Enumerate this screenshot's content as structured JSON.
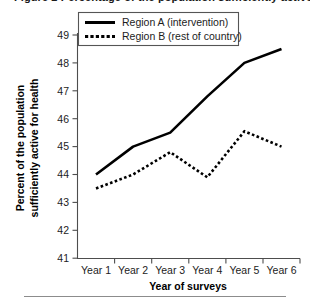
{
  "figure": {
    "clipped_caption_fragment": "Figure 2  Percentage of the population sufficiently active",
    "bottom_rule": "horizontal-rule"
  },
  "legend": {
    "position": "top-left-inside",
    "entries": [
      {
        "label": "Region A (intervention)",
        "style": "solid"
      },
      {
        "label": "Region B (rest of country)",
        "style": "dashed"
      }
    ]
  },
  "axes": {
    "y_title_line1": "Percent of the population",
    "y_title_line2": "sufficiently active for health",
    "x_title": "Year of surveys",
    "y_ticks": [
      "41",
      "42",
      "43",
      "44",
      "45",
      "46",
      "47",
      "48",
      "49"
    ],
    "x_ticks": [
      "Year 1",
      "Year 2",
      "Year 3",
      "Year 4",
      "Year 5",
      "Year 6"
    ]
  },
  "chart_data": {
    "type": "line",
    "title": "",
    "subtitle": "",
    "xlabel": "Year of surveys",
    "ylabel": "Percent of the population sufficiently active for health",
    "categories": [
      "Year 1",
      "Year 2",
      "Year 3",
      "Year 4",
      "Year 5",
      "Year 6"
    ],
    "series": [
      {
        "name": "Region A (intervention)",
        "style": "solid",
        "color": "#000000",
        "values": [
          44.0,
          45.0,
          45.5,
          46.8,
          48.0,
          48.5
        ]
      },
      {
        "name": "Region B (rest of country)",
        "style": "dashed",
        "color": "#000000",
        "values": [
          43.5,
          44.0,
          44.8,
          43.9,
          45.55,
          45.0
        ]
      }
    ],
    "ylim": [
      41,
      49
    ],
    "ytick_step": 1,
    "grid": false,
    "legend_position": "upper left"
  }
}
